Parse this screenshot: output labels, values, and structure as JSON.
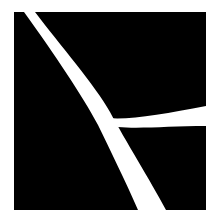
{
  "image": {
    "description": "Abstract black square with white curved strokes forming a branching shape",
    "width": 220,
    "height": 217,
    "background_color": "#ffffff",
    "square": {
      "color": "#000000",
      "x": 14,
      "y": 12,
      "width": 192,
      "height": 198
    },
    "strokes": [
      {
        "name": "main-diagonal-stroke",
        "color": "#ffffff",
        "path": "M24,12 L35,12 C60,45 95,85 110,112 C125,140 150,180 166,210 L138,210 C125,180 110,150 98,125 C82,95 55,55 24,12 Z"
      },
      {
        "name": "right-branch-stroke",
        "color": "#ffffff",
        "path": "M108,118 C130,120 165,114 206,106 L206,126 C170,126 140,129 118,127 Z"
      }
    ]
  }
}
